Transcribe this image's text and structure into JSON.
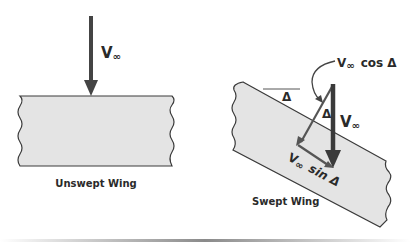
{
  "unswept": {
    "velocity_label": "V",
    "velocity_subscript": "∞",
    "caption": "Unswept Wing"
  },
  "swept": {
    "sweep_angle_label": "Δ",
    "inner_angle_label": "Δ",
    "freestream_label": "V",
    "freestream_subscript": "∞",
    "normal_component_label": "V",
    "normal_component_subscript": "∞",
    "normal_component_fn": "cos Δ",
    "tangential_component_label": "V",
    "tangential_component_subscript": "∞",
    "tangential_component_fn": "sin Δ",
    "caption": "Swept Wing"
  },
  "colors": {
    "wing_fill": "#e4e4e4",
    "stroke": "#3a3a3a",
    "arrow_dark": "#3a3a3a",
    "arrow_light": "#555555"
  }
}
